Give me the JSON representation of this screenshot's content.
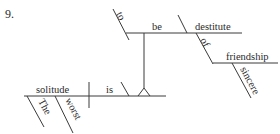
{
  "diagram": {
    "number": "9.",
    "type": "sentence-diagram",
    "sentence_words": {
      "subject": "solitude",
      "subject_modifiers": [
        "The",
        "worst"
      ],
      "verb": "is",
      "predicate_phrase": {
        "infinitive_marker": "to",
        "verb": "be",
        "complement": "destitute",
        "preposition": "of",
        "object": "friendship",
        "object_modifier": "sincere"
      }
    },
    "labels": {
      "to": "to",
      "be": "be",
      "destitute": "destitute",
      "of": "of",
      "friendship": "friendship",
      "sincere": "sincere",
      "solitude": "solitude",
      "is": "is",
      "the": "The",
      "worst": "worst"
    }
  }
}
